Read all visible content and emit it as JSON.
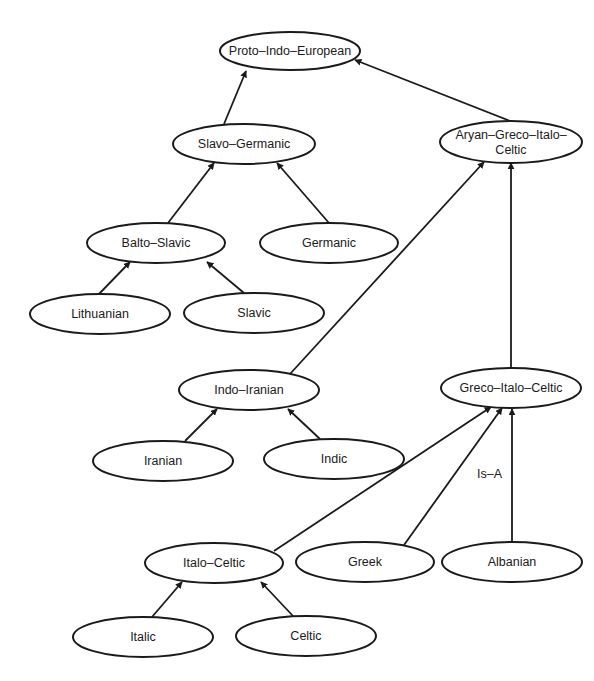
{
  "diagram": {
    "type": "taxonomy-tree",
    "stroke_color": "#1a1a1a",
    "background": "#ffffff",
    "nodes": [
      {
        "id": "pie",
        "label": [
          "Proto–Indo–European"
        ],
        "cx": 290,
        "cy": 51,
        "rx": 70,
        "ry": 19
      },
      {
        "id": "slavo_germanic",
        "label": [
          "Slavo–Germanic"
        ],
        "cx": 244,
        "cy": 144,
        "rx": 71,
        "ry": 20
      },
      {
        "id": "aryan_greco_italo_celtic",
        "label": [
          "Aryan–Greco–Italo–",
          "Celtic"
        ],
        "cx": 511,
        "cy": 142,
        "rx": 71,
        "ry": 21
      },
      {
        "id": "balto_slavic",
        "label": [
          "Balto–Slavic"
        ],
        "cx": 156,
        "cy": 243,
        "rx": 69,
        "ry": 20
      },
      {
        "id": "germanic",
        "label": [
          "Germanic"
        ],
        "cx": 329,
        "cy": 243,
        "rx": 69,
        "ry": 20
      },
      {
        "id": "lithuanian",
        "label": [
          "Lithuanian"
        ],
        "cx": 100,
        "cy": 314,
        "rx": 70,
        "ry": 20
      },
      {
        "id": "slavic",
        "label": [
          "Slavic"
        ],
        "cx": 254,
        "cy": 313,
        "rx": 70,
        "ry": 20
      },
      {
        "id": "indo_iranian",
        "label": [
          "Indo–Iranian"
        ],
        "cx": 249,
        "cy": 390,
        "rx": 70,
        "ry": 20
      },
      {
        "id": "greco_italo_celtic",
        "label": [
          "Greco–Italo–Celtic"
        ],
        "cx": 511,
        "cy": 388,
        "rx": 70,
        "ry": 20
      },
      {
        "id": "iranian",
        "label": [
          "Iranian"
        ],
        "cx": 163,
        "cy": 461,
        "rx": 70,
        "ry": 20
      },
      {
        "id": "indic",
        "label": [
          "Indic"
        ],
        "cx": 334,
        "cy": 459,
        "rx": 70,
        "ry": 20
      },
      {
        "id": "italo_celtic",
        "label": [
          "Italo–Celtic"
        ],
        "cx": 214,
        "cy": 563,
        "rx": 69,
        "ry": 20
      },
      {
        "id": "greek",
        "label": [
          "Greek"
        ],
        "cx": 365,
        "cy": 562,
        "rx": 69,
        "ry": 20
      },
      {
        "id": "albanian",
        "label": [
          "Albanian"
        ],
        "cx": 512,
        "cy": 562,
        "rx": 70,
        "ry": 20
      },
      {
        "id": "italic",
        "label": [
          "Italic"
        ],
        "cx": 143,
        "cy": 637,
        "rx": 70,
        "ry": 20
      },
      {
        "id": "celtic",
        "label": [
          "Celtic"
        ],
        "cx": 306,
        "cy": 636,
        "rx": 70,
        "ry": 20
      }
    ],
    "edges": [
      {
        "from": "slavo_germanic",
        "to": "pie",
        "x1": 224,
        "y1": 124,
        "x2": 246,
        "y2": 71
      },
      {
        "from": "aryan_greco_italo_celtic",
        "to": "pie",
        "x1": 510,
        "y1": 121,
        "x2": 355,
        "y2": 60
      },
      {
        "from": "balto_slavic",
        "to": "slavo_germanic",
        "x1": 168,
        "y1": 223,
        "x2": 214,
        "y2": 163
      },
      {
        "from": "germanic",
        "to": "slavo_germanic",
        "x1": 329,
        "y1": 223,
        "x2": 277,
        "y2": 163
      },
      {
        "from": "lithuanian",
        "to": "balto_slavic",
        "x1": 99,
        "y1": 294,
        "x2": 130,
        "y2": 262
      },
      {
        "from": "slavic",
        "to": "balto_slavic",
        "x1": 244,
        "y1": 293,
        "x2": 207,
        "y2": 262
      },
      {
        "from": "indo_iranian",
        "to": "aryan_greco_italo_celtic",
        "x1": 290,
        "y1": 374,
        "x2": 484,
        "y2": 162
      },
      {
        "from": "greco_italo_celtic",
        "to": "aryan_greco_italo_celtic",
        "x1": 511,
        "y1": 368,
        "x2": 511,
        "y2": 163
      },
      {
        "from": "iranian",
        "to": "indo_iranian",
        "x1": 185,
        "y1": 441,
        "x2": 217,
        "y2": 409
      },
      {
        "from": "indic",
        "to": "indo_iranian",
        "x1": 320,
        "y1": 439,
        "x2": 288,
        "y2": 409
      },
      {
        "from": "italo_celtic",
        "to": "greco_italo_celtic",
        "x1": 274,
        "y1": 551,
        "x2": 491,
        "y2": 407
      },
      {
        "from": "greek",
        "to": "greco_italo_celtic",
        "x1": 404,
        "y1": 545,
        "x2": 502,
        "y2": 408
      },
      {
        "from": "albanian",
        "to": "greco_italo_celtic",
        "x1": 512,
        "y1": 542,
        "x2": 512,
        "y2": 409,
        "label": "Is–A",
        "label_x": 477,
        "label_y": 478
      },
      {
        "from": "italic",
        "to": "italo_celtic",
        "x1": 152,
        "y1": 617,
        "x2": 182,
        "y2": 582
      },
      {
        "from": "celtic",
        "to": "italo_celtic",
        "x1": 293,
        "y1": 616,
        "x2": 261,
        "y2": 582
      }
    ],
    "edge_label": "Is–A"
  }
}
